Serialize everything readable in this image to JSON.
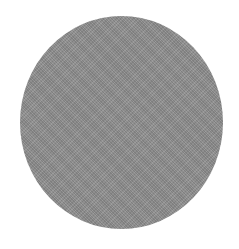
{
  "shape": {
    "type": "circle",
    "fill_color": "#8e8e8e",
    "texture": "noise"
  },
  "background_color": "#ffffff"
}
